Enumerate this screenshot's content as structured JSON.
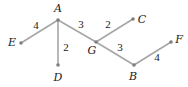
{
  "graph": {
    "nodes": [
      {
        "id": "A",
        "x": 58,
        "y": 20,
        "lx": 58,
        "ly": 12
      },
      {
        "id": "E",
        "x": 21,
        "y": 43,
        "lx": 12,
        "ly": 46
      },
      {
        "id": "D",
        "x": 58,
        "y": 65,
        "lx": 58,
        "ly": 81
      },
      {
        "id": "G",
        "x": 96,
        "y": 42,
        "lx": 92,
        "ly": 54
      },
      {
        "id": "C",
        "x": 133,
        "y": 19,
        "lx": 142,
        "ly": 23
      },
      {
        "id": "B",
        "x": 134,
        "y": 65,
        "lx": 133,
        "ly": 80
      },
      {
        "id": "F",
        "x": 171,
        "y": 42,
        "lx": 179,
        "ly": 43
      }
    ],
    "edges": [
      {
        "from": "A",
        "to": "E",
        "weight": "4",
        "lx": 36,
        "ly": 29
      },
      {
        "from": "A",
        "to": "D",
        "weight": "2",
        "lx": 66,
        "ly": 51
      },
      {
        "from": "A",
        "to": "G",
        "weight": "3",
        "lx": 81,
        "ly": 28
      },
      {
        "from": "G",
        "to": "C",
        "weight": "2",
        "lx": 108,
        "ly": 28
      },
      {
        "from": "G",
        "to": "B",
        "weight": "3",
        "lx": 120,
        "ly": 51
      },
      {
        "from": "B",
        "to": "F",
        "weight": "4",
        "lx": 157,
        "ly": 61
      }
    ]
  }
}
